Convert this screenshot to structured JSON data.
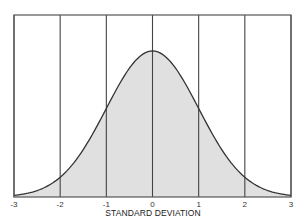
{
  "chart_data": {
    "type": "area",
    "title": "",
    "xlabel": "STANDARD DEVIATION",
    "ylabel": "",
    "x_ticks": [
      "-3",
      "-2",
      "-1",
      "0",
      "1",
      "2",
      "3"
    ],
    "xlim": [
      -3,
      3
    ],
    "ylim": [
      0,
      0.45
    ],
    "grid": {
      "vertical": true,
      "horizontal": false
    },
    "legend": null,
    "series": [
      {
        "name": "Normal distribution (standard normal PDF)",
        "x": [
          -3,
          -2.5,
          -2,
          -1.5,
          -1,
          -0.5,
          0,
          0.5,
          1,
          1.5,
          2,
          2.5,
          3
        ],
        "y": [
          0.0044,
          0.0175,
          0.054,
          0.1295,
          0.242,
          0.352,
          0.399,
          0.352,
          0.242,
          0.1295,
          0.054,
          0.0175,
          0.0044
        ],
        "fill": "#e0e0e0",
        "line": "#333333"
      }
    ]
  },
  "colors": {
    "frame": "#555555",
    "grid": "#444444",
    "curve": "#333333",
    "fill": "#e0e0e0"
  }
}
